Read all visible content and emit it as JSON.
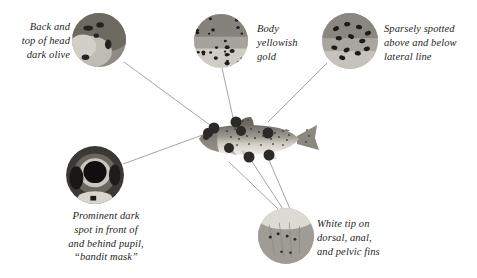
{
  "figure": {
    "background_color": "#ffffff",
    "text_color": "#231f1d",
    "leader_line_color": "#8d8d8d"
  },
  "callouts": [
    {
      "id": "back-and-top-of-head",
      "text": "Back and\ntop of head\ndark olive",
      "align": "right",
      "text_box": {
        "left": 8,
        "top": 20,
        "width": 62
      },
      "inset": {
        "name": "inset-head-top",
        "cx": 99,
        "cy": 40,
        "r": 27,
        "style": "dark-olive-back"
      },
      "leader": {
        "from_x": 124,
        "from_y": 62,
        "to_x": 214,
        "to_y": 128
      }
    },
    {
      "id": "body-yellowish-gold",
      "text": "Body\nyellowish\ngold",
      "align": "left",
      "text_box": {
        "left": 257,
        "top": 22,
        "width": 62
      },
      "inset": {
        "name": "inset-body-flank",
        "cx": 221,
        "cy": 41,
        "r": 27,
        "style": "spotted-flank"
      },
      "leader": {
        "from_x": 222,
        "from_y": 68,
        "to_x": 236,
        "to_y": 131
      }
    },
    {
      "id": "sparsely-spotted",
      "text": "Sparsely spotted\nabove and below\nlateral line",
      "align": "left",
      "text_box": {
        "left": 384,
        "top": 22,
        "width": 92
      },
      "inset": {
        "name": "inset-lateral-line",
        "cx": 350,
        "cy": 41,
        "r": 28,
        "style": "sparse-spots"
      },
      "leader": {
        "from_x": 327,
        "from_y": 63,
        "to_x": 268,
        "to_y": 122
      }
    },
    {
      "id": "prominent-dark-spot",
      "text": "Prominent dark\nspot in front of\nand behind pupil,\n“bandit mask”",
      "align": "center",
      "text_box": {
        "left": 52,
        "top": 209,
        "width": 108
      },
      "inset": {
        "name": "inset-eye-bandit-mask",
        "cx": 95,
        "cy": 175,
        "r": 29,
        "style": "eye-closeup"
      },
      "leader": {
        "from_x": 123,
        "from_y": 164,
        "to_x": 208,
        "to_y": 133
      }
    },
    {
      "id": "white-tip-fins",
      "text": "White tip on\ndorsal, anal,\nand pelvic fins",
      "align": "left",
      "text_box": {
        "left": 317,
        "top": 217,
        "width": 86
      },
      "inset": {
        "name": "inset-fin-white-tip",
        "cx": 286,
        "cy": 236,
        "r": 28,
        "style": "fin-closeup"
      },
      "leader_group": [
        {
          "from_x": 278,
          "from_y": 209,
          "to_x": 229,
          "to_y": 162
        },
        {
          "from_x": 283,
          "from_y": 209,
          "to_x": 249,
          "to_y": 157
        },
        {
          "from_x": 290,
          "from_y": 209,
          "to_x": 269,
          "to_y": 160
        }
      ]
    }
  ],
  "fish": {
    "name": "trout-illustration",
    "box": {
      "left": 193,
      "top": 112,
      "width": 124,
      "height": 58
    },
    "marker_color": "#2b2a28",
    "markers": [
      {
        "name": "marker-head-top",
        "cx": 214,
        "cy": 128,
        "r": 5.5
      },
      {
        "name": "marker-dorsal-fin",
        "cx": 236,
        "cy": 122,
        "r": 5.5
      },
      {
        "name": "marker-flank",
        "cx": 241,
        "cy": 131,
        "r": 5.0
      },
      {
        "name": "marker-lateral-line",
        "cx": 268,
        "cy": 133,
        "r": 5.5
      },
      {
        "name": "marker-eye",
        "cx": 208,
        "cy": 133,
        "r": 5.0
      },
      {
        "name": "marker-pelvic-fin",
        "cx": 229,
        "cy": 148,
        "r": 5.0
      },
      {
        "name": "marker-anal-fin",
        "cx": 249,
        "cy": 157,
        "r": 5.5
      },
      {
        "name": "marker-caudal-peduncle",
        "cx": 269,
        "cy": 155,
        "r": 5.5
      }
    ]
  }
}
